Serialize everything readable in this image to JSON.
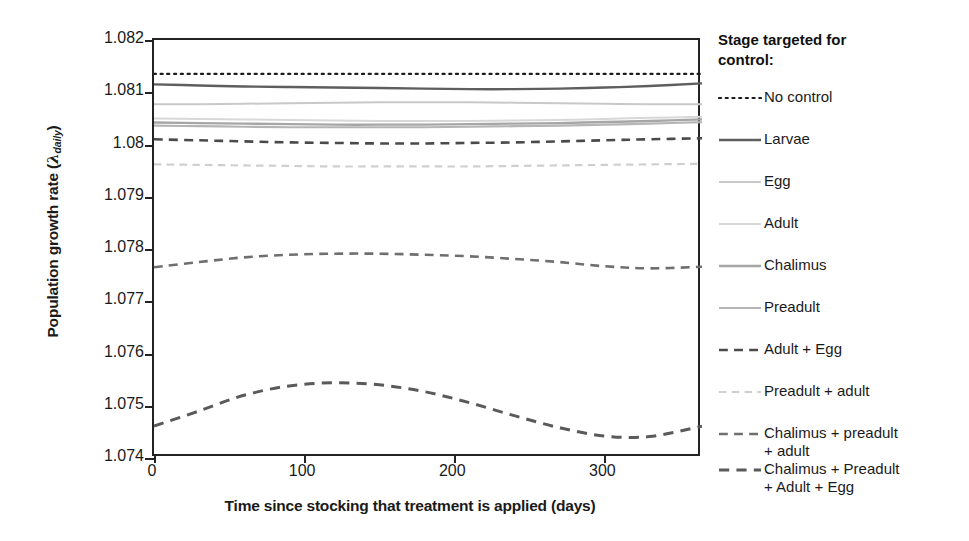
{
  "chart_data": {
    "type": "line",
    "title": "",
    "xlabel": "Time since stocking that treatment is applied (days)",
    "ylabel": "Population growth rate (λ_daily)",
    "ylabel_main": "Population growth rate (",
    "ylabel_symbol": "λ",
    "ylabel_subscript": "daily",
    "ylabel_close": ")",
    "xlim": [
      0,
      365
    ],
    "ylim": [
      1.074,
      1.082
    ],
    "xticks": [
      0,
      100,
      200,
      300
    ],
    "xtick_labels": [
      "0",
      "100",
      "200",
      "300"
    ],
    "yticks": [
      1.074,
      1.075,
      1.076,
      1.077,
      1.078,
      1.079,
      1.08,
      1.081,
      1.082
    ],
    "ytick_labels": [
      "1.074",
      "1.075",
      "1.076",
      "1.077",
      "1.078",
      "1.079",
      "1.08",
      "1.081",
      "1.082"
    ],
    "grid": false,
    "legend_position": "right",
    "legend_title": "Stage targeted for control:",
    "x": [
      0,
      30,
      60,
      90,
      120,
      150,
      180,
      210,
      240,
      270,
      300,
      330,
      365
    ],
    "series": [
      {
        "name": "No control",
        "style": "dotted",
        "color": "#1b1b1b",
        "width": 2.2,
        "values": [
          1.08135,
          1.08135,
          1.08135,
          1.08135,
          1.08135,
          1.08135,
          1.08135,
          1.08135,
          1.08135,
          1.08135,
          1.08135,
          1.08135,
          1.08135
        ]
      },
      {
        "name": "Larvae",
        "style": "solid",
        "color": "#5e5e5e",
        "width": 2.4,
        "values": [
          1.08115,
          1.08113,
          1.08111,
          1.0811,
          1.08109,
          1.08108,
          1.08107,
          1.08106,
          1.08106,
          1.08107,
          1.08109,
          1.08112,
          1.08117
        ]
      },
      {
        "name": "Egg",
        "style": "solid",
        "color": "#c9c9c9",
        "width": 2.0,
        "values": [
          1.08077,
          1.08077,
          1.08078,
          1.08079,
          1.0808,
          1.08081,
          1.08081,
          1.08081,
          1.0808,
          1.08079,
          1.08078,
          1.08077,
          1.08077
        ]
      },
      {
        "name": "Adult",
        "style": "solid",
        "color": "#d8d8d8",
        "width": 2.0,
        "values": [
          1.0805,
          1.08049,
          1.08048,
          1.08047,
          1.08046,
          1.08045,
          1.08045,
          1.08045,
          1.08046,
          1.08047,
          1.08049,
          1.08051,
          1.08053
        ]
      },
      {
        "name": "Chalimus",
        "style": "solid",
        "color": "#a6a6a6",
        "width": 2.4,
        "values": [
          1.08042,
          1.08041,
          1.0804,
          1.08039,
          1.08038,
          1.08038,
          1.08038,
          1.08039,
          1.0804,
          1.08041,
          1.08043,
          1.08045,
          1.08048
        ]
      },
      {
        "name": "Preadult",
        "style": "solid",
        "color": "#b5b5b5",
        "width": 2.2,
        "values": [
          1.08036,
          1.08035,
          1.08034,
          1.08033,
          1.08033,
          1.08033,
          1.08033,
          1.08034,
          1.08035,
          1.08036,
          1.08038,
          1.0804,
          1.08043
        ]
      },
      {
        "name": "Adult + Egg",
        "style": "dashed",
        "color": "#4a4a4a",
        "width": 2.6,
        "values": [
          1.0801,
          1.08008,
          1.08006,
          1.08004,
          1.08003,
          1.08002,
          1.08002,
          1.08003,
          1.08004,
          1.08006,
          1.08008,
          1.0801,
          1.08012
        ]
      },
      {
        "name": "Preadult + adult",
        "style": "dashed",
        "color": "#cfcfcf",
        "width": 2.2,
        "values": [
          1.07962,
          1.07961,
          1.0796,
          1.07959,
          1.07958,
          1.07958,
          1.07958,
          1.07958,
          1.07959,
          1.0796,
          1.07961,
          1.07962,
          1.07963
        ]
      },
      {
        "name": "Chalimus + preadult + adult",
        "style": "dashed",
        "color": "#6f6f6f",
        "width": 2.6,
        "values": [
          1.07765,
          1.07775,
          1.07784,
          1.07789,
          1.07791,
          1.07791,
          1.07789,
          1.07786,
          1.07781,
          1.07775,
          1.07767,
          1.07763,
          1.07766
        ]
      },
      {
        "name": "Chalimus + Preadult + Adult + Egg",
        "style": "dashed",
        "color": "#5a5a5a",
        "width": 3.0,
        "values": [
          1.07461,
          1.0749,
          1.0752,
          1.07538,
          1.07544,
          1.0754,
          1.07527,
          1.07506,
          1.07481,
          1.07458,
          1.07442,
          1.07441,
          1.07461
        ]
      }
    ]
  },
  "legend": {
    "title": "Stage targeted for control:",
    "items": [
      {
        "label": "No control"
      },
      {
        "label": "Larvae"
      },
      {
        "label": "Egg"
      },
      {
        "label": "Adult"
      },
      {
        "label": "Chalimus"
      },
      {
        "label": "Preadult"
      },
      {
        "label": "Adult + Egg"
      },
      {
        "label": "Preadult + adult"
      },
      {
        "label": "Chalimus + preadult\n+ adult"
      },
      {
        "label": "Chalimus + Preadult\n+ Adult + Egg"
      }
    ]
  },
  "axes": {
    "x_title": "Time since stocking that treatment is applied (days)",
    "y_title_pre": "Population growth rate (",
    "y_title_symbol": "λ",
    "y_title_sub": "daily",
    "y_title_post": ")"
  }
}
